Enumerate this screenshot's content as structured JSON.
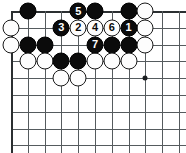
{
  "diagram": {
    "kind": "go-board-diagram",
    "title": "",
    "board": {
      "columns": 11,
      "rows": 9,
      "origin_x": 11,
      "origin_y": 11,
      "spacing": 16.8,
      "top_edge": true,
      "left_edge": true,
      "line_color": "#555b5e",
      "edge_color": "#2b2f31",
      "background": "#ffffff"
    },
    "star_points": [
      {
        "name": "star-point-1",
        "col": 9,
        "row": 5
      }
    ],
    "move_sequence": [
      {
        "number": "1",
        "color": "black",
        "col": 8,
        "row": 2
      },
      {
        "number": "2",
        "color": "white",
        "col": 5,
        "row": 2
      },
      {
        "number": "3",
        "color": "black",
        "col": 4,
        "row": 2
      },
      {
        "number": "4",
        "color": "white",
        "col": 6,
        "row": 2
      },
      {
        "number": "5",
        "color": "black",
        "col": 5,
        "row": 1
      },
      {
        "number": "6",
        "color": "white",
        "col": 7,
        "row": 2
      },
      {
        "number": "7",
        "color": "black",
        "col": 6,
        "row": 3
      }
    ],
    "stones": [
      {
        "color": "black",
        "col": 2,
        "row": 1,
        "label": ""
      },
      {
        "color": "black",
        "col": 5,
        "row": 1,
        "label": "5"
      },
      {
        "color": "black",
        "col": 6,
        "row": 1,
        "label": ""
      },
      {
        "color": "black",
        "col": 8,
        "row": 1,
        "label": ""
      },
      {
        "color": "white",
        "col": 9,
        "row": 1,
        "label": ""
      },
      {
        "color": "white",
        "col": 1,
        "row": 2,
        "label": ""
      },
      {
        "color": "black",
        "col": 4,
        "row": 2,
        "label": "3"
      },
      {
        "color": "white",
        "col": 5,
        "row": 2,
        "label": "2"
      },
      {
        "color": "white",
        "col": 6,
        "row": 2,
        "label": "4"
      },
      {
        "color": "white",
        "col": 7,
        "row": 2,
        "label": "6"
      },
      {
        "color": "black",
        "col": 8,
        "row": 2,
        "label": "1"
      },
      {
        "color": "white",
        "col": 9,
        "row": 2,
        "label": ""
      },
      {
        "color": "white",
        "col": 1,
        "row": 3,
        "label": ""
      },
      {
        "color": "black",
        "col": 2,
        "row": 3,
        "label": ""
      },
      {
        "color": "black",
        "col": 3,
        "row": 3,
        "label": ""
      },
      {
        "color": "black",
        "col": 6,
        "row": 3,
        "label": "7"
      },
      {
        "color": "black",
        "col": 7,
        "row": 3,
        "label": ""
      },
      {
        "color": "black",
        "col": 8,
        "row": 3,
        "label": ""
      },
      {
        "color": "white",
        "col": 9,
        "row": 3,
        "label": ""
      },
      {
        "color": "white",
        "col": 2,
        "row": 4,
        "label": ""
      },
      {
        "color": "white",
        "col": 3,
        "row": 4,
        "label": ""
      },
      {
        "color": "black",
        "col": 4,
        "row": 4,
        "label": ""
      },
      {
        "color": "black",
        "col": 5,
        "row": 4,
        "label": ""
      },
      {
        "color": "white",
        "col": 6,
        "row": 4,
        "label": ""
      },
      {
        "color": "white",
        "col": 7,
        "row": 4,
        "label": ""
      },
      {
        "color": "white",
        "col": 8,
        "row": 4,
        "label": ""
      },
      {
        "color": "white",
        "col": 4,
        "row": 5,
        "label": ""
      },
      {
        "color": "white",
        "col": 5,
        "row": 5,
        "label": ""
      }
    ]
  }
}
